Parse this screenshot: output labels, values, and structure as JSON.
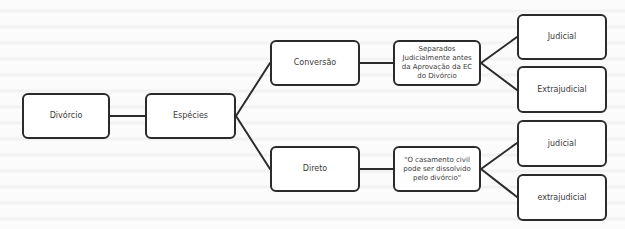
{
  "diagram": {
    "type": "tree",
    "root": {
      "label": "Divórcio",
      "child": {
        "label": "Espécies",
        "children": [
          {
            "label": "Conversão",
            "child": {
              "label": "Separados Judicialmente antes da Aprovação da EC do Divórcio",
              "children": [
                {
                  "label": "Judicial"
                },
                {
                  "label": "Extrajudicial"
                }
              ]
            }
          },
          {
            "label": "Direto",
            "child": {
              "label": "\"O casamento civil pode ser dissolvido pelo divórcio\"",
              "children": [
                {
                  "label": "judicial"
                },
                {
                  "label": "extrajudicial"
                }
              ]
            }
          }
        ]
      }
    }
  },
  "nodes": {
    "divorcio": "Divórcio",
    "especies": "Espécies",
    "conversao": "Conversão",
    "direto": "Direto",
    "separados": "Separados Judicialmente antes da Aprovação da EC do Divórcio",
    "casamento": "\"O casamento civil pode ser dissolvido pelo divórcio\"",
    "judicial_upper": "Judicial",
    "extrajudicial_upper": "Extrajudicial",
    "judicial_lower": "judicial",
    "extrajudicial_lower": "extrajudicial"
  },
  "colors": {
    "border": "#2b2b2b",
    "text": "#3a3a3a",
    "background": "#fbfbfb",
    "node_fill": "#ffffff"
  }
}
